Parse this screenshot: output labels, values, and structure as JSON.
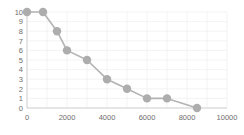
{
  "chart_data": {
    "type": "line",
    "title": "",
    "subtitle": "",
    "xlabel": "",
    "ylabel": "",
    "xlim": [
      0,
      10000
    ],
    "ylim": [
      0,
      10
    ],
    "grid": true,
    "legend": false,
    "marker": "circle",
    "marker_color": "#adadad",
    "line_color": "#b3b3b3",
    "axis_color": "#c9c9c9",
    "grid_color": "#f0f0f2",
    "tick_label_color": "#6e6e6e",
    "background": "#ffffff",
    "x": [
      0,
      800,
      1500,
      2000,
      3000,
      4000,
      5000,
      6000,
      7000,
      8500
    ],
    "y": [
      10,
      10,
      8,
      6,
      5,
      3,
      2,
      1,
      1,
      0
    ],
    "points": [
      {
        "x": 0,
        "y": 10
      },
      {
        "x": 800,
        "y": 10
      },
      {
        "x": 1500,
        "y": 8
      },
      {
        "x": 2000,
        "y": 6
      },
      {
        "x": 3000,
        "y": 5
      },
      {
        "x": 4000,
        "y": 3
      },
      {
        "x": 5000,
        "y": 2
      },
      {
        "x": 6000,
        "y": 1
      },
      {
        "x": 7000,
        "y": 1
      },
      {
        "x": 8500,
        "y": 0
      }
    ],
    "xticks": [
      0,
      2000,
      4000,
      6000,
      8000,
      10000
    ],
    "xticklabels": [
      "0",
      "2000",
      "4000",
      "6000",
      "8000",
      "10000"
    ],
    "yticks": [
      0,
      1,
      2,
      3,
      4,
      5,
      6,
      7,
      8,
      9,
      10
    ],
    "yticklabels": [
      "0",
      "1",
      "2",
      "3",
      "4",
      "5",
      "6",
      "7",
      "8",
      "9",
      "10"
    ],
    "xgridlines": [
      0,
      1000,
      2000,
      3000,
      4000,
      5000,
      6000,
      7000,
      8000,
      9000,
      10000
    ],
    "ygridlines": [
      0,
      1,
      2,
      3,
      4,
      5,
      6,
      7,
      8,
      9,
      10
    ]
  }
}
